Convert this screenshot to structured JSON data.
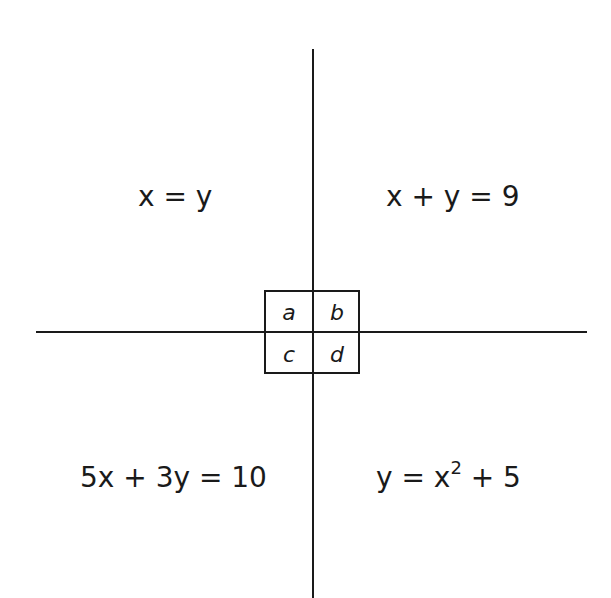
{
  "diagram": {
    "quadrants": {
      "top_left": {
        "equation": "x = y"
      },
      "top_right": {
        "equation": "x + y = 9"
      },
      "bottom_left": {
        "equation": "5x + 3y = 10"
      },
      "bottom_right": {
        "equation_base": "y = x",
        "exponent": "2",
        "equation_tail": " + 5"
      }
    },
    "center_box": {
      "cells": [
        "a",
        "b",
        "c",
        "d"
      ]
    },
    "colors": {
      "line": "#1a1a1a",
      "background": "#ffffff"
    }
  }
}
